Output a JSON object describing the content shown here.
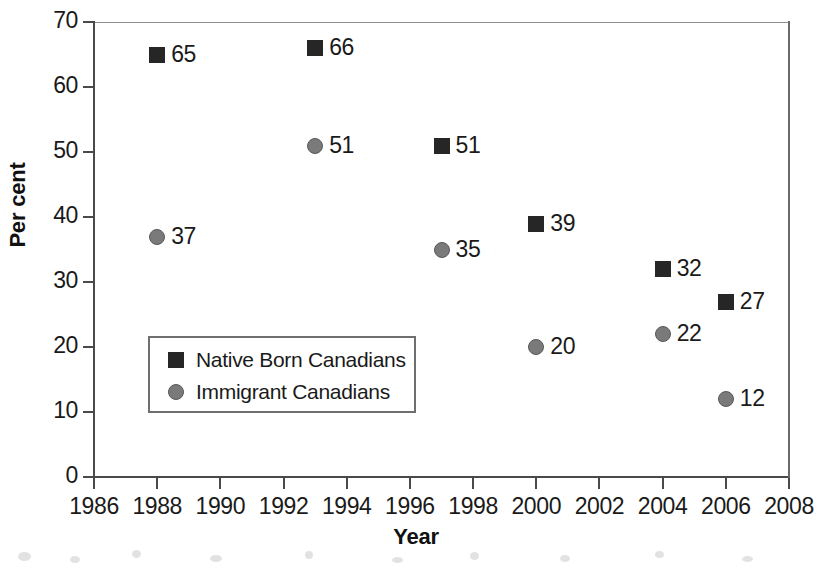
{
  "chart_data": {
    "type": "scatter",
    "title": "",
    "xlabel": "Year",
    "ylabel": "Per cent",
    "xlim": [
      1986,
      2008
    ],
    "ylim": [
      0,
      70
    ],
    "x_ticks": [
      1986,
      1988,
      1990,
      1992,
      1994,
      1996,
      1998,
      2000,
      2002,
      2004,
      2006,
      2008
    ],
    "x_tick_labels": [
      "1986",
      "1988",
      "1990",
      "1992",
      "1994",
      "1996",
      "1998",
      "2000",
      "2002",
      "2004",
      "2006",
      "2008"
    ],
    "y_ticks": [
      0,
      10,
      20,
      30,
      40,
      50,
      60,
      70
    ],
    "y_tick_labels": [
      "0",
      "10",
      "20",
      "30",
      "40",
      "50",
      "60",
      "70"
    ],
    "grid": false,
    "legend_position": "lower-left-inside",
    "series": [
      {
        "name": "Native Born Canadians",
        "marker": "square",
        "color": "#262626",
        "x": [
          1988,
          1993,
          1997,
          2000,
          2004,
          2006
        ],
        "values": [
          65,
          66,
          51,
          39,
          32,
          27
        ],
        "labels": [
          "65",
          "66",
          "51",
          "39",
          "32",
          "27"
        ]
      },
      {
        "name": "Immigrant Canadians",
        "marker": "circle",
        "color": "#7a7a7a",
        "x": [
          1988,
          1993,
          1997,
          2000,
          2004,
          2006
        ],
        "values": [
          37,
          51,
          35,
          20,
          22,
          12
        ],
        "labels": [
          "37",
          "51",
          "35",
          "20",
          "22",
          "12"
        ]
      }
    ]
  },
  "axes": {
    "y_title": "Per cent",
    "x_title": "Year",
    "y_labels": [
      "70",
      "60",
      "50",
      "40",
      "30",
      "20",
      "10",
      "0"
    ],
    "x_labels": [
      "1986",
      "1988",
      "1990",
      "1992",
      "1994",
      "1996",
      "1998",
      "2000",
      "2002",
      "2004",
      "2006",
      "2008"
    ]
  },
  "legend": {
    "entries": [
      {
        "label": "Native Born Canadians",
        "marker": "square"
      },
      {
        "label": "Immigrant Canadians",
        "marker": "circle"
      }
    ]
  },
  "points": {
    "native": [
      {
        "label": "65",
        "year": "1988",
        "value": "65"
      },
      {
        "label": "66",
        "year": "1993",
        "value": "66"
      },
      {
        "label": "51",
        "year": "1997",
        "value": "51"
      },
      {
        "label": "39",
        "year": "2000",
        "value": "39"
      },
      {
        "label": "32",
        "year": "2004",
        "value": "32"
      },
      {
        "label": "27",
        "year": "2006",
        "value": "27"
      }
    ],
    "immigrant": [
      {
        "label": "37",
        "year": "1988",
        "value": "37"
      },
      {
        "label": "51",
        "year": "1993",
        "value": "51"
      },
      {
        "label": "35",
        "year": "1997",
        "value": "35"
      },
      {
        "label": "20",
        "year": "2000",
        "value": "20"
      },
      {
        "label": "22",
        "year": "2004",
        "value": "22"
      },
      {
        "label": "12",
        "year": "2006",
        "value": "12"
      }
    ]
  },
  "colors": {
    "native_marker": "#262626",
    "immigrant_marker": "#7a7a7a",
    "axis": "#4a4a4a",
    "frame": "#8d8d8d",
    "text": "#1a1a1a",
    "background": "#ffffff"
  }
}
